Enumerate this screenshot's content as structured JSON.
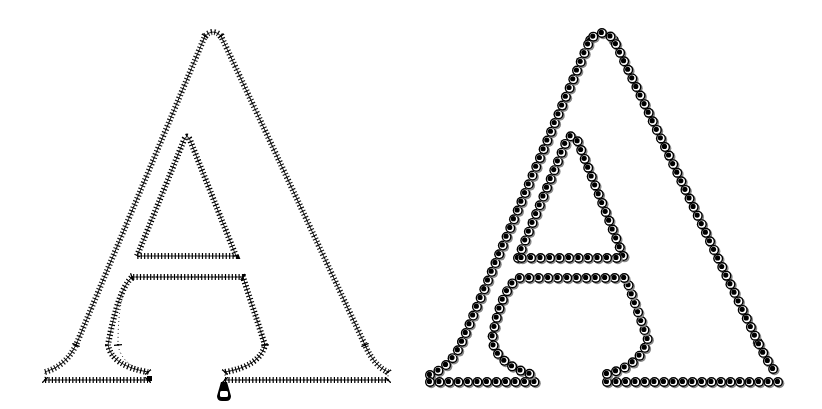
{
  "figure": {
    "description": "Two outlined capital letter A shapes",
    "letter": "A",
    "panels": [
      {
        "name": "zipper-letter",
        "style": "zipper teeth outline with zipper pull",
        "color": "#000000"
      },
      {
        "name": "bead-letter",
        "style": "chain of black beads with white ring and shadow",
        "color": "#000000"
      }
    ],
    "background": "#ffffff"
  }
}
